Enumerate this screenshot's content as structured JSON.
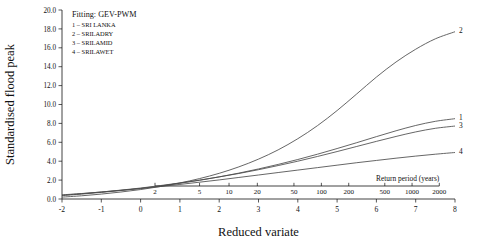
{
  "chart_data": {
    "type": "line",
    "title": "",
    "xlabel": "Reduced variate",
    "ylabel": "Standardised flood peak",
    "xlim": [
      -2,
      8
    ],
    "ylim": [
      0,
      20
    ],
    "grid": false,
    "legend_position": "top-left",
    "legend_title": "Fitting: GEV-PWM",
    "x_ticks": [
      "-2",
      "-1",
      "0",
      "1",
      "2",
      "3",
      "4",
      "5",
      "6",
      "7",
      "8"
    ],
    "x_tick_values": [
      -2,
      -1,
      0,
      1,
      2,
      3,
      4,
      5,
      6,
      7,
      8
    ],
    "y_ticks": [
      "0.0",
      "2.0",
      "4.0",
      "6.0",
      "8.0",
      "10.0",
      "12.0",
      "14.0",
      "16.0",
      "18.0",
      "20.0"
    ],
    "y_tick_values": [
      0,
      2,
      4,
      6,
      8,
      10,
      12,
      14,
      16,
      18,
      20
    ],
    "secondary_xaxis_label": "Return period (years)",
    "secondary_x_ticks": [
      "2",
      "5",
      "10",
      "20",
      "50",
      "100",
      "200",
      "500",
      "1000",
      "2000"
    ],
    "secondary_x_tick_values": [
      2,
      5,
      10,
      20,
      50,
      100,
      200,
      500,
      1000,
      2000
    ],
    "series": [
      {
        "name": "SRI LANKA",
        "label": "1",
        "x": [
          -2,
          -1.5,
          -1,
          -0.5,
          0,
          0.5,
          1,
          1.5,
          2,
          2.5,
          3,
          3.5,
          4,
          4.5,
          5,
          5.5,
          6,
          6.5,
          7,
          7.5,
          8
        ],
        "values": [
          0.36,
          0.52,
          0.7,
          0.9,
          1.12,
          1.38,
          1.66,
          1.98,
          2.34,
          2.74,
          3.18,
          3.66,
          4.18,
          4.74,
          5.34,
          5.96,
          6.6,
          7.22,
          7.78,
          8.22,
          8.5
        ]
      },
      {
        "name": "SRILADRY",
        "label": "2",
        "x": [
          -2,
          -1.5,
          -1,
          -0.5,
          0,
          0.5,
          1,
          1.5,
          2,
          2.5,
          3,
          3.5,
          4,
          4.5,
          5,
          5.5,
          6,
          6.5,
          7,
          7.5,
          8
        ],
        "values": [
          0.2,
          0.34,
          0.52,
          0.74,
          1.0,
          1.32,
          1.7,
          2.16,
          2.72,
          3.4,
          4.22,
          5.2,
          6.38,
          7.76,
          9.36,
          11.12,
          12.9,
          14.5,
          15.85,
          16.95,
          17.7
        ]
      },
      {
        "name": "SRILAMID",
        "label": "3",
        "x": [
          -2,
          -1.5,
          -1,
          -0.5,
          0,
          0.5,
          1,
          1.5,
          2,
          2.5,
          3,
          3.5,
          4,
          4.5,
          5,
          5.5,
          6,
          6.5,
          7,
          7.5,
          8
        ],
        "values": [
          0.4,
          0.56,
          0.74,
          0.94,
          1.16,
          1.42,
          1.7,
          2.0,
          2.34,
          2.7,
          3.1,
          3.54,
          4.0,
          4.5,
          5.02,
          5.56,
          6.1,
          6.62,
          7.1,
          7.48,
          7.72
        ]
      },
      {
        "name": "SRILAWET",
        "label": "4",
        "x": [
          -2,
          -1.5,
          -1,
          -0.5,
          0,
          0.5,
          1,
          1.5,
          2,
          2.5,
          3,
          3.5,
          4,
          4.5,
          5,
          5.5,
          6,
          6.5,
          7,
          7.5,
          8
        ],
        "values": [
          0.44,
          0.58,
          0.74,
          0.92,
          1.1,
          1.32,
          1.54,
          1.78,
          2.02,
          2.28,
          2.54,
          2.8,
          3.06,
          3.32,
          3.58,
          3.84,
          4.08,
          4.32,
          4.54,
          4.74,
          4.92
        ]
      }
    ]
  },
  "legend": {
    "heading": "Fitting: GEV-PWM",
    "entries": [
      "1 – SRI LANKA",
      "2 – SRILADRY",
      "3 – SRILAMID",
      "4 – SRILAWET"
    ]
  },
  "axes": {
    "x_title": "Reduced variate",
    "y_title": "Standardised flood peak",
    "secondary_title": "Return period (years)"
  }
}
